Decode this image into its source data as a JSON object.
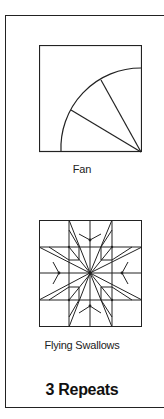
{
  "blocks": [
    {
      "name": "Fan",
      "label": "Fan"
    },
    {
      "name": "Flying Swallows",
      "label": "Flying Swallows"
    }
  ],
  "footer": {
    "label": "3 Repeats"
  }
}
